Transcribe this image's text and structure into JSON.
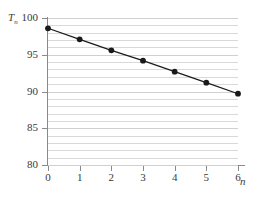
{
  "chart_data": {
    "type": "line",
    "title": "",
    "xlabel": "n",
    "ylabel": "T_n",
    "ylabel_base": "T",
    "ylabel_sub": "n",
    "x": [
      0,
      1,
      2,
      3,
      4,
      5,
      6
    ],
    "values": [
      98.6,
      97.1,
      95.6,
      94.2,
      92.7,
      91.2,
      89.7
    ],
    "series": [
      {
        "name": "T_n",
        "values": [
          98.6,
          97.1,
          95.6,
          94.2,
          92.7,
          91.2,
          89.7
        ]
      }
    ],
    "xlim": [
      0,
      6
    ],
    "ylim": [
      80,
      100
    ],
    "x_tick_labels": [
      "0",
      "1",
      "2",
      "3",
      "4",
      "5",
      "6"
    ],
    "y_tick_labels": [
      "80",
      "85",
      "90",
      "95",
      "100"
    ],
    "y_major_ticks": [
      80,
      85,
      90,
      95,
      100
    ],
    "y_minor_gridlines": [
      81,
      82,
      83,
      84,
      86,
      87,
      88,
      89,
      91,
      92,
      93,
      94,
      96,
      97,
      98,
      99
    ],
    "grid": true,
    "grid_axis": "y",
    "legend": false,
    "legend_position": "none",
    "marker": "filled-circle",
    "marker_color": "#1a1a1a",
    "line_color": "#1a1a1a",
    "grid_color": "#d9d9d9",
    "axis_color": "#8a8a8a",
    "background": "#ffffff"
  }
}
